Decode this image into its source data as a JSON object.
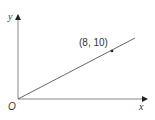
{
  "diagram": {
    "axes": {
      "x_label": "x",
      "y_label": "y",
      "origin_label": "O"
    },
    "line": {
      "from": [
        0,
        0
      ],
      "passes_through": [
        8,
        10
      ]
    },
    "point": {
      "label": "(8, 10)",
      "x": 8,
      "y": 10
    }
  }
}
